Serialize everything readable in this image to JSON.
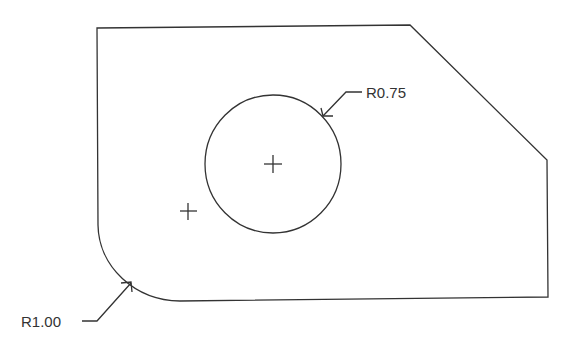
{
  "diagram": {
    "type": "engineering-part-drawing",
    "line_color": "#333333",
    "dimensions": [
      {
        "id": "hole-radius",
        "label": "R0.75",
        "refers_to": "circular hole"
      },
      {
        "id": "fillet-radius",
        "label": "R1.00",
        "refers_to": "bottom-left corner fillet"
      }
    ],
    "features": [
      "outer profile with chamfered top-right corner",
      "filleted bottom-left corner",
      "circular hole with center mark",
      "arc center mark"
    ]
  }
}
